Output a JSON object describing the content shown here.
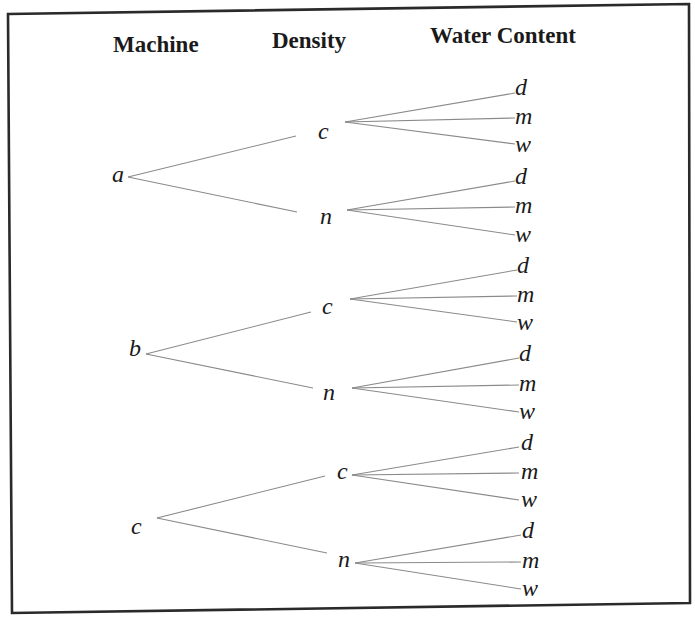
{
  "headers": {
    "level1": "Machine",
    "level2": "Density",
    "level3": "Water Content"
  },
  "tree": [
    {
      "label": "a",
      "children": [
        {
          "label": "c",
          "children": [
            "d",
            "m",
            "w"
          ]
        },
        {
          "label": "n",
          "children": [
            "d",
            "m",
            "w"
          ]
        }
      ]
    },
    {
      "label": "b",
      "children": [
        {
          "label": "c",
          "children": [
            "d",
            "m",
            "w"
          ]
        },
        {
          "label": "n",
          "children": [
            "d",
            "m",
            "w"
          ]
        }
      ]
    },
    {
      "label": "c",
      "children": [
        {
          "label": "c",
          "children": [
            "d",
            "m",
            "w"
          ]
        },
        {
          "label": "n",
          "children": [
            "d",
            "m",
            "w"
          ]
        }
      ]
    }
  ],
  "colors": {
    "text": "#1a1a1a",
    "edge": "#8a8a8a",
    "border": "#2a2a2a",
    "background": "#ffffff"
  }
}
